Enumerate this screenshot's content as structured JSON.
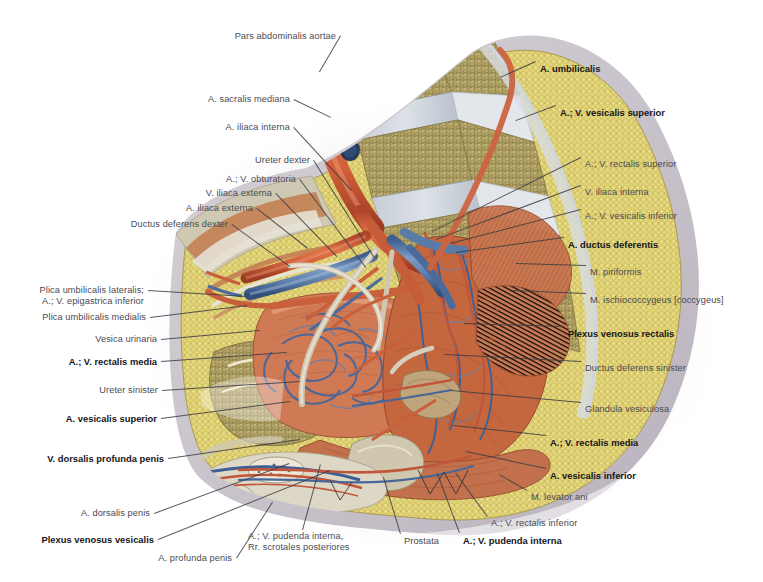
{
  "plate": {
    "title": "Pelvic vessels of the male pelvis (right half-sagittal / medial view)",
    "background": "#ffffff",
    "label_color": "#4a4a52",
    "bold_label_color": "#16161a",
    "leader_color": "#3b3b44",
    "width": 763,
    "height": 582
  },
  "labels": [
    {
      "id": "pars-abdominalis-aortae",
      "text": "Pars abdominalis aortae",
      "bold": false,
      "align": "right",
      "x": 336,
      "y": 31,
      "leader": [
        341,
        36,
        320,
        72
      ]
    },
    {
      "id": "a-sacralis-mediana",
      "text": "A. sacralis mediana",
      "bold": false,
      "align": "right",
      "x": 290,
      "y": 94,
      "leader": [
        294,
        99,
        331,
        117
      ]
    },
    {
      "id": "a-iliaca-interna",
      "text": "A. iliaca interna",
      "bold": false,
      "align": "right",
      "x": 290,
      "y": 122,
      "leader": [
        294,
        127,
        352,
        190
      ]
    },
    {
      "id": "ureter-dexter",
      "text": "Ureter dexter",
      "bold": false,
      "align": "right",
      "x": 310,
      "y": 155,
      "leader": [
        314,
        160,
        375,
        258
      ]
    },
    {
      "id": "a-v-obturatoria",
      "text": "A.; V. obturatoria",
      "bold": false,
      "align": "right",
      "x": 296,
      "y": 174,
      "leader": [
        300,
        179,
        366,
        267
      ]
    },
    {
      "id": "v-iliaca-externa",
      "text": "V. iliaca externa",
      "bold": false,
      "align": "right",
      "x": 272,
      "y": 188,
      "leader": [
        276,
        193,
        337,
        256
      ]
    },
    {
      "id": "a-iliaca-externa",
      "text": "A. iliaca externa",
      "bold": false,
      "align": "right",
      "x": 253,
      "y": 203,
      "leader": [
        257,
        208,
        308,
        248
      ]
    },
    {
      "id": "ductus-deferens-dexter",
      "text": "Ductus deferens dexter",
      "bold": false,
      "align": "right",
      "x": 228,
      "y": 219,
      "leader": [
        232,
        224,
        290,
        266
      ]
    },
    {
      "id": "plica-umbilicalis-lateralis",
      "text": "Plica umbilicalis lateralis;\nA.; V. epigastrica inferior",
      "bold": false,
      "align": "right",
      "x": 144,
      "y": 285,
      "leader": [
        148,
        290,
        246,
        296
      ]
    },
    {
      "id": "plica-umbilicalis-medialis",
      "text": "Plica umbilicalis medialis",
      "bold": false,
      "align": "right",
      "x": 146,
      "y": 312,
      "leader": [
        150,
        317,
        247,
        305
      ]
    },
    {
      "id": "vesica-urinaria",
      "text": "Vesica urinaria",
      "bold": false,
      "align": "right",
      "x": 157,
      "y": 334,
      "leader": [
        161,
        339,
        260,
        330
      ]
    },
    {
      "id": "a-v-rectalis-media-left",
      "text": "A.; V. rectalis media",
      "bold": true,
      "align": "right",
      "x": 157,
      "y": 356,
      "leader": [
        161,
        361,
        287,
        352
      ]
    },
    {
      "id": "ureter-sinister",
      "text": "Ureter sinister",
      "bold": false,
      "align": "right",
      "x": 158,
      "y": 385,
      "leader": [
        162,
        390,
        300,
        381
      ]
    },
    {
      "id": "a-vesicalis-superior-left",
      "text": "A. vesicalis superior",
      "bold": true,
      "align": "right",
      "x": 157,
      "y": 413,
      "leader": [
        161,
        418,
        290,
        401
      ]
    },
    {
      "id": "v-dorsalis-profunda-penis",
      "text": "V. dorsalis profunda penis",
      "bold": true,
      "align": "right",
      "x": 164,
      "y": 453,
      "leader": [
        168,
        458,
        300,
        439
      ]
    },
    {
      "id": "a-dorsalis-penis",
      "text": "A. dorsalis penis",
      "bold": false,
      "align": "right",
      "x": 150,
      "y": 508,
      "leader": [
        154,
        513,
        289,
        463
      ]
    },
    {
      "id": "plexus-venosus-vesicalis",
      "text": "Plexus venosus vesicalis",
      "bold": true,
      "align": "right",
      "x": 154,
      "y": 534,
      "leader": [
        158,
        539,
        330,
        470
      ]
    },
    {
      "id": "a-profunda-penis",
      "text": "A. profunda penis",
      "bold": false,
      "align": "right",
      "x": 232,
      "y": 553,
      "leader": [
        236,
        558,
        272,
        502
      ]
    },
    {
      "id": "a-v-pudenda-interna-rr-scrotales",
      "text": "A.; V. pudenda interna,\nRr. scrotales posteriores",
      "bold": false,
      "align": "left",
      "x": 248,
      "y": 531,
      "leader": [
        302,
        530,
        320,
        464
      ]
    },
    {
      "id": "prostata",
      "text": "Prostata",
      "bold": false,
      "align": "left",
      "x": 404,
      "y": 536,
      "leader": [
        400,
        534,
        383,
        478
      ]
    },
    {
      "id": "a-v-pudenda-interna",
      "text": "A.; V. pudenda interna",
      "bold": true,
      "align": "left",
      "x": 463,
      "y": 535,
      "leader": [
        459,
        533,
        437,
        474
      ]
    },
    {
      "id": "a-v-rectalis-inferior",
      "text": "A.; V. rectalis inferior",
      "bold": false,
      "align": "left",
      "x": 491,
      "y": 518,
      "leader": [
        487,
        517,
        455,
        473
      ]
    },
    {
      "id": "m-levator-ani",
      "text": "M. levator ani",
      "bold": false,
      "align": "left",
      "x": 531,
      "y": 492,
      "leader": [
        527,
        491,
        499,
        475
      ]
    },
    {
      "id": "a-vesicalis-inferior",
      "text": "A. vesicalis inferior",
      "bold": true,
      "align": "left",
      "x": 550,
      "y": 470,
      "leader": [
        546,
        469,
        466,
        452
      ]
    },
    {
      "id": "a-v-rectalis-media-right",
      "text": "A.; V. rectalis media",
      "bold": true,
      "align": "left",
      "x": 550,
      "y": 437,
      "leader": [
        546,
        436,
        454,
        426
      ]
    },
    {
      "id": "glandula-vesiculosa",
      "text": "Glandula vesiculosa",
      "bold": false,
      "align": "left",
      "x": 585,
      "y": 404,
      "leader": [
        581,
        403,
        452,
        391
      ]
    },
    {
      "id": "ductus-deferens-sinister",
      "text": "Ductus deferens sinister",
      "bold": false,
      "align": "left",
      "x": 585,
      "y": 363,
      "leader": [
        581,
        362,
        444,
        355
      ]
    },
    {
      "id": "plexus-venosus-rectalis",
      "text": "Plexus venosus rectalis",
      "bold": true,
      "align": "left",
      "x": 568,
      "y": 328,
      "leader": [
        564,
        327,
        464,
        324
      ]
    },
    {
      "id": "m-ischiococcygeus",
      "text": "M. ischiococcygeus [coccygeus]",
      "bold": false,
      "align": "left",
      "x": 590,
      "y": 295,
      "leader": [
        586,
        294,
        513,
        291
      ]
    },
    {
      "id": "m-piriformis",
      "text": "M. piriformis",
      "bold": false,
      "align": "left",
      "x": 590,
      "y": 267,
      "leader": [
        586,
        266,
        516,
        264
      ]
    },
    {
      "id": "a-ductus-deferentis",
      "text": "A. ductus deferentis",
      "bold": true,
      "align": "left",
      "x": 568,
      "y": 239,
      "leader": [
        564,
        238,
        456,
        253
      ]
    },
    {
      "id": "a-v-vesicalis-inferior",
      "text": "A.; V. vesicalis inferior",
      "bold": false,
      "align": "left",
      "x": 585,
      "y": 211,
      "leader": [
        581,
        210,
        450,
        244
      ]
    },
    {
      "id": "v-iliaca-interna",
      "text": "V. iliaca interna",
      "bold": false,
      "align": "left",
      "x": 585,
      "y": 187,
      "leader": [
        581,
        186,
        436,
        240
      ]
    },
    {
      "id": "a-v-rectalis-superior",
      "text": "A.; V. rectalis superior",
      "bold": false,
      "align": "left",
      "x": 585,
      "y": 159,
      "leader": [
        581,
        158,
        432,
        232
      ]
    },
    {
      "id": "a-v-vesicalis-superior",
      "text": "A.; V. vesicalis superior",
      "bold": true,
      "align": "left",
      "x": 560,
      "y": 107,
      "leader": [
        556,
        106,
        516,
        121
      ]
    },
    {
      "id": "a-umbilicalis",
      "text": "A. umbilicalis",
      "bold": true,
      "align": "left",
      "x": 540,
      "y": 63,
      "leader": [
        536,
        62,
        500,
        78
      ]
    }
  ],
  "figure": {
    "name": "male-pelvis-vessels-illustration",
    "caption": "Half-sagittal dissection of the male pelvis showing arteries, veins, bladder, prostate and pelvic floor muscles"
  }
}
